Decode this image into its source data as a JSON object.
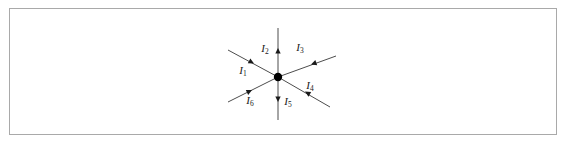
{
  "figure": {
    "background_color": "#ffffff",
    "frame": {
      "name": "figure-border",
      "color": "#a9a9a9",
      "x": 9,
      "y": 8,
      "width": 548,
      "height": 127
    },
    "junction": {
      "label": "junction-node",
      "x": 278,
      "y": 77,
      "radius": 4.2,
      "color": "#000000"
    },
    "wire_color": "#4d4d4d",
    "arrow_color": "#1a1a1a",
    "branches": [
      {
        "id": "I1",
        "symbol": "I",
        "subscript": "1",
        "label_x": 243,
        "label_y": 74,
        "line": {
          "x1": 228,
          "y1": 50,
          "x2": 278,
          "y2": 77
        },
        "arrow": {
          "x": 254,
          "y": 63.5,
          "angle_deg": 28.4
        },
        "direction": "into-junction",
        "orientation": "upper-left"
      },
      {
        "id": "I2",
        "symbol": "I",
        "subscript": "2",
        "label_x": 265,
        "label_y": 52,
        "line": {
          "x1": 278,
          "y1": 28,
          "x2": 278,
          "y2": 77
        },
        "arrow": {
          "x": 278,
          "y": 48,
          "angle_deg": -90
        },
        "direction": "out-of-junction",
        "orientation": "up"
      },
      {
        "id": "I3",
        "symbol": "I",
        "subscript": "3",
        "label_x": 300,
        "label_y": 51,
        "line": {
          "x1": 278,
          "y1": 77,
          "x2": 336,
          "y2": 56
        },
        "arrow": {
          "x": 311,
          "y": 64.5,
          "angle_deg": 160.1
        },
        "direction": "into-junction",
        "orientation": "upper-right"
      },
      {
        "id": "I4",
        "symbol": "I",
        "subscript": "4",
        "label_x": 310,
        "label_y": 89,
        "line": {
          "x1": 278,
          "y1": 77,
          "x2": 330,
          "y2": 107
        },
        "arrow": {
          "x": 305,
          "y": 91.5,
          "angle_deg": 209.9
        },
        "direction": "into-junction",
        "orientation": "lower-right"
      },
      {
        "id": "I5",
        "symbol": "I",
        "subscript": "5",
        "label_x": 288,
        "label_y": 105,
        "line": {
          "x1": 278,
          "y1": 77,
          "x2": 278,
          "y2": 120
        },
        "arrow": {
          "x": 278,
          "y": 102,
          "angle_deg": 90
        },
        "direction": "out-of-junction",
        "orientation": "down"
      },
      {
        "id": "I6",
        "symbol": "I",
        "subscript": "6",
        "label_x": 250,
        "label_y": 104,
        "line": {
          "x1": 228,
          "y1": 102,
          "x2": 278,
          "y2": 77
        },
        "arrow": {
          "x": 252,
          "y": 90,
          "angle_deg": -26.6
        },
        "direction": "into-junction",
        "orientation": "lower-left"
      }
    ]
  }
}
